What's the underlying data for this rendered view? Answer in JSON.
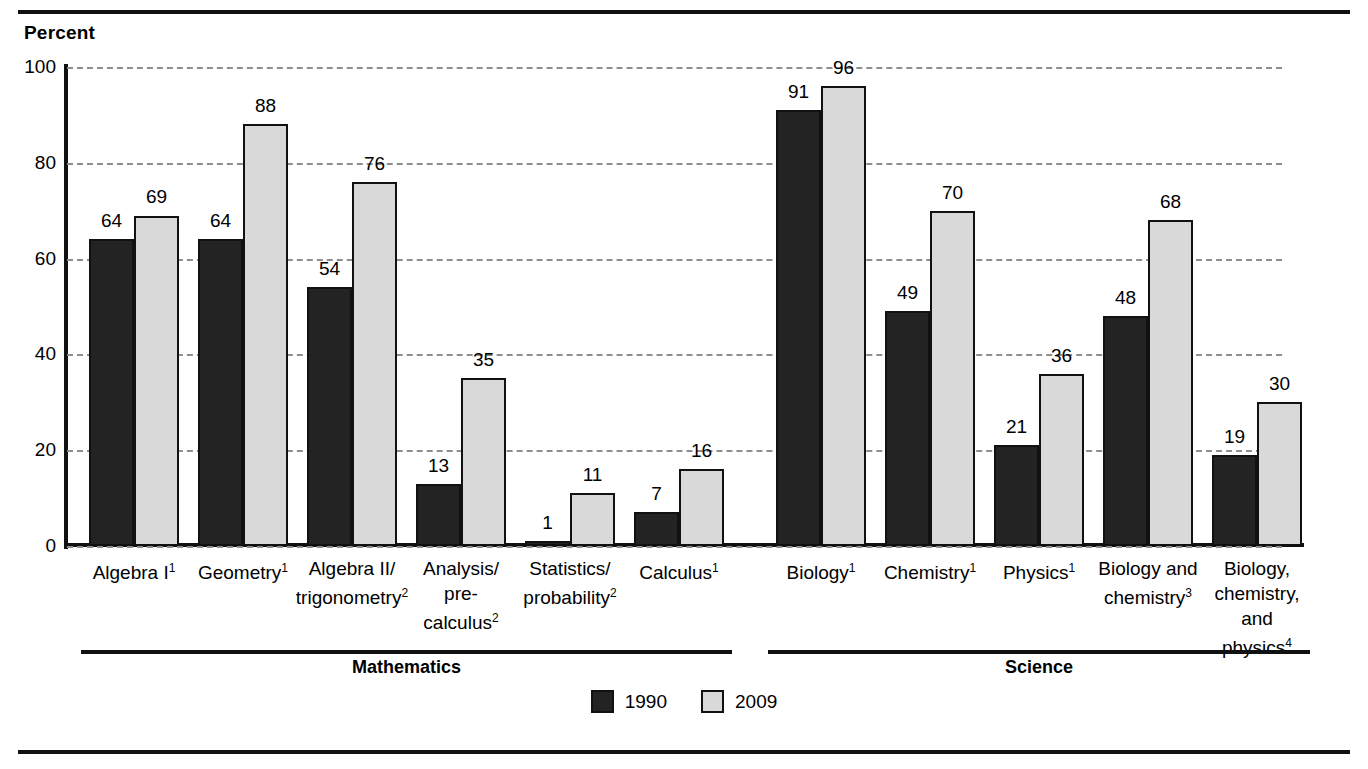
{
  "rules": {
    "top": "horizontal-rule",
    "bottom": "horizontal-rule"
  },
  "axis_title": "Percent",
  "legend": {
    "items": [
      {
        "label": "1990",
        "color": "#232323",
        "key": "y1990"
      },
      {
        "label": "2009",
        "color": "#d9d9d9",
        "key": "y2009"
      }
    ]
  },
  "groups": [
    {
      "label": "Mathematics",
      "start_index": 0,
      "end_index": 5
    },
    {
      "label": "Science",
      "start_index": 6,
      "end_index": 10
    }
  ],
  "chart_data": {
    "type": "bar",
    "title": "",
    "subtitle": "",
    "xlabel": "",
    "ylabel": "Percent",
    "ylim": [
      0,
      100
    ],
    "yticks": [
      0,
      20,
      40,
      60,
      80,
      100
    ],
    "ytick_labels": [
      "0",
      "20",
      "40",
      "60",
      "80",
      "100"
    ],
    "grid": true,
    "grid_style": "dashed-horizontal",
    "legend_position": "bottom-center",
    "categories": [
      "Algebra I",
      "Geometry",
      "Algebra II/\ntrigonometry",
      "Analysis/\npre-\ncalculus",
      "Statistics/\nprobability",
      "Calculus",
      "Biology",
      "Chemistry",
      "Physics",
      "Biology and\nchemistry",
      "Biology,\nchemistry,\nand\nphysics"
    ],
    "category_footnotes": [
      "1",
      "1",
      "2",
      "2",
      "2",
      "1",
      "1",
      "1",
      "1",
      "3",
      "4"
    ],
    "series": [
      {
        "name": "1990",
        "color": "#232323",
        "values": [
          64,
          64,
          54,
          13,
          1,
          7,
          91,
          49,
          21,
          48,
          19
        ]
      },
      {
        "name": "2009",
        "color": "#d9d9d9",
        "values": [
          69,
          88,
          76,
          35,
          11,
          16,
          96,
          70,
          36,
          68,
          30
        ]
      }
    ]
  }
}
